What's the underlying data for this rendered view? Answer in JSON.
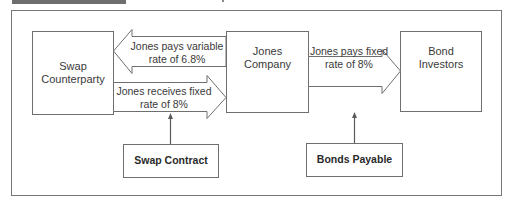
{
  "diagram": {
    "nodes": {
      "swap_counterparty": {
        "line1": "Swap",
        "line2": "Counterparty"
      },
      "jones_company": {
        "line1": "Jones",
        "line2": "Company"
      },
      "bond_investors": {
        "line1": "Bond",
        "line2": "Investors"
      },
      "swap_contract": {
        "label": "Swap Contract"
      },
      "bonds_payable": {
        "label": "Bonds Payable"
      }
    },
    "arrows": {
      "pays_variable": {
        "line1": "Jones pays variable",
        "line2": "rate of 6.8%",
        "from": "Jones Company",
        "to": "Swap Counterparty"
      },
      "receives_fixed": {
        "line1": "Jones receives fixed",
        "line2": "rate of 8%",
        "from": "Swap Counterparty",
        "to": "Jones Company"
      },
      "pays_fixed": {
        "line1": "Jones pays fixed",
        "line2": "rate of 8%",
        "from": "Jones Company",
        "to": "Bond Investors"
      }
    },
    "connectors": [
      {
        "from": "Swap Contract",
        "to": "swap arrows"
      },
      {
        "from": "Bonds Payable",
        "to": "pays fixed arrow"
      }
    ],
    "colors": {
      "stroke": "#6f6f6f",
      "text": "#3a3a3a",
      "header_bar": "#6d6d6d"
    }
  }
}
